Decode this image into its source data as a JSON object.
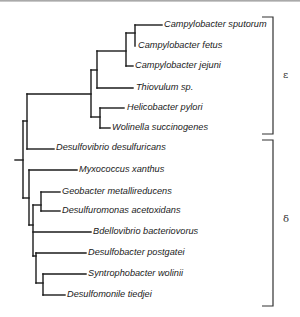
{
  "figure": {
    "type": "phylogenetic-tree",
    "line_color": "#1a1a1a",
    "bracket_color": "#333333"
  },
  "leaves": [
    {
      "label": "Campylobacter sputorum",
      "x": 164,
      "y": 25
    },
    {
      "label": "Campylobacter fetus",
      "x": 138,
      "y": 46
    },
    {
      "label": "Campylobacter jejuni",
      "x": 135,
      "y": 66
    },
    {
      "label": "Thiovulum sp.",
      "x": 136,
      "y": 88
    },
    {
      "label": "Helicobacter pylori",
      "x": 127,
      "y": 108
    },
    {
      "label": "Wolinella succinogenes",
      "x": 112,
      "y": 128
    },
    {
      "label": "Desulfovibrio desulfuricans",
      "x": 56,
      "y": 148
    },
    {
      "label": "Myxococcus xanthus",
      "x": 79,
      "y": 170
    },
    {
      "label": "Geobacter metallireducens",
      "x": 62,
      "y": 192
    },
    {
      "label": "Desulfuromonas acetoxidans",
      "x": 62,
      "y": 211
    },
    {
      "label": "Bdellovibrio bacteriovorus",
      "x": 93,
      "y": 232
    },
    {
      "label": "Desulfobacter postgatei",
      "x": 88,
      "y": 253
    },
    {
      "label": "Syntrophobacter wolinii",
      "x": 88,
      "y": 274
    },
    {
      "label": "Desulfomonile tiedjei",
      "x": 67,
      "y": 295
    }
  ],
  "clades": [
    {
      "symbol": "ε",
      "name": "epsilon",
      "x": 283,
      "y": 70,
      "bracket": {
        "x": 273,
        "y1": 17,
        "y2": 134,
        "tick_left": 262
      }
    },
    {
      "symbol": "δ",
      "name": "delta",
      "x": 283,
      "y": 214,
      "bracket": {
        "x": 273,
        "y1": 140,
        "y2": 306,
        "tick_left": 262
      }
    }
  ],
  "segments": [
    [
      15,
      160,
      23,
      160
    ],
    [
      23,
      121,
      23,
      198
    ],
    [
      23,
      121,
      27,
      121
    ],
    [
      27,
      94,
      27,
      149
    ],
    [
      27,
      94,
      91,
      94
    ],
    [
      27,
      149,
      54,
      149
    ],
    [
      91,
      70,
      91,
      117
    ],
    [
      91,
      70,
      97,
      70
    ],
    [
      97,
      51,
      97,
      88
    ],
    [
      97,
      51,
      126,
      51
    ],
    [
      97,
      88,
      133,
      88
    ],
    [
      126,
      33,
      126,
      66
    ],
    [
      126,
      33,
      135,
      33
    ],
    [
      135,
      25,
      135,
      46
    ],
    [
      135,
      25,
      162,
      25
    ],
    [
      126,
      66,
      133,
      66
    ],
    [
      91,
      117,
      100,
      117
    ],
    [
      100,
      108,
      100,
      128
    ],
    [
      100,
      108,
      124,
      108
    ],
    [
      100,
      128,
      110,
      128
    ],
    [
      23,
      198,
      29,
      198
    ],
    [
      29,
      170,
      29,
      225
    ],
    [
      29,
      170,
      77,
      170
    ],
    [
      29,
      225,
      33,
      225
    ],
    [
      33,
      205,
      33,
      256
    ],
    [
      33,
      205,
      41,
      205
    ],
    [
      41,
      192,
      41,
      211
    ],
    [
      41,
      192,
      60,
      192
    ],
    [
      41,
      211,
      60,
      211
    ],
    [
      33,
      232,
      91,
      232
    ],
    [
      33,
      256,
      36,
      256
    ],
    [
      36,
      253,
      36,
      283
    ],
    [
      36,
      253,
      86,
      253
    ],
    [
      36,
      283,
      43,
      283
    ],
    [
      43,
      274,
      43,
      295
    ],
    [
      43,
      274,
      86,
      274
    ],
    [
      43,
      295,
      65,
      295
    ]
  ]
}
